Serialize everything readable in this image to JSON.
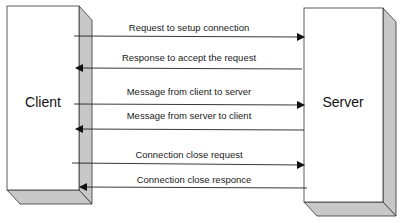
{
  "diagram": {
    "type": "sequence",
    "nodes": {
      "client": {
        "label": "Client"
      },
      "server": {
        "label": "Server"
      }
    },
    "messages": [
      {
        "label": "Request to setup connection",
        "direction": "client-to-server"
      },
      {
        "label": "Response to accept the request",
        "direction": "server-to-client"
      },
      {
        "label": "Message from client to server",
        "direction": "client-to-server"
      },
      {
        "label": "Message from server to client",
        "direction": "server-to-client"
      },
      {
        "label": "Connection close request",
        "direction": "client-to-server"
      },
      {
        "label": "Connection close responce",
        "direction": "server-to-client"
      }
    ],
    "colors": {
      "box_face": "#ffffff",
      "box_side": "#c8c8c8",
      "line": "#222222"
    }
  }
}
